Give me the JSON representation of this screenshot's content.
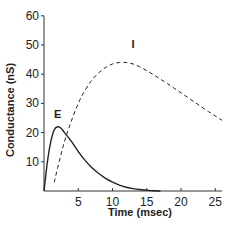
{
  "chart_data": {
    "type": "line",
    "title": "",
    "xlabel": "Time (msec)",
    "ylabel": "Conductance (nS)",
    "xlim": [
      0,
      26
    ],
    "ylim": [
      0,
      60
    ],
    "xticks": [
      5,
      10,
      15,
      20,
      25
    ],
    "yticks": [
      10,
      20,
      30,
      40,
      50,
      60
    ],
    "grid": false,
    "series": [
      {
        "name": "E",
        "style": "solid",
        "x": [
          0,
          0.5,
          1,
          1.5,
          2,
          2.5,
          3,
          4,
          5,
          6,
          7,
          8,
          9,
          10,
          11,
          12,
          13,
          14,
          15,
          16,
          17
        ],
        "values": [
          0,
          10,
          17,
          21,
          22,
          21.5,
          20,
          17,
          13.5,
          10.5,
          8,
          6,
          4.3,
          3,
          2,
          1.3,
          0.8,
          0.5,
          0.3,
          0.1,
          0
        ]
      },
      {
        "name": "I",
        "style": "dashed",
        "x": [
          1.5,
          2,
          3,
          4,
          5,
          6,
          7,
          8,
          9,
          10,
          11,
          12,
          13,
          14,
          15,
          16,
          17,
          18,
          19,
          20,
          21,
          22,
          23,
          24,
          25,
          26
        ],
        "values": [
          3,
          8,
          17,
          24,
          30,
          34.5,
          38,
          40.5,
          42.3,
          43.5,
          44,
          44,
          43.5,
          42.5,
          41.2,
          39.8,
          38.3,
          36.8,
          35.2,
          33.6,
          32,
          30.4,
          28.8,
          27.2,
          25.7,
          24.2
        ]
      }
    ],
    "annotations": [
      {
        "text": "E",
        "x": 2,
        "y": 25
      },
      {
        "text": "I",
        "x": 13,
        "y": 49
      }
    ]
  }
}
